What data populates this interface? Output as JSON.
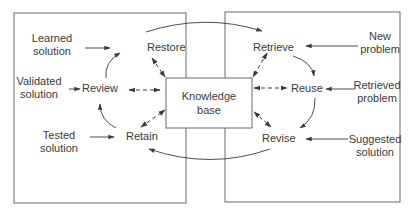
{
  "diagram": {
    "type": "CBR cycle with knowledge base",
    "center": {
      "label_line1": "Knowledge",
      "label_line2": "base"
    },
    "left_cycle": {
      "nodes": [
        "Restore",
        "Review",
        "Retain"
      ],
      "inputs": [
        {
          "line1": "Learned",
          "line2": "solution",
          "target": "Restore"
        },
        {
          "line1": "Validated",
          "line2": "solution",
          "target": "Review"
        },
        {
          "line1": "Tested",
          "line2": "solution",
          "target": "Retain"
        }
      ]
    },
    "right_cycle": {
      "nodes": [
        "Retrieve",
        "Reuse",
        "Revise"
      ],
      "inputs": [
        {
          "line1": "New",
          "line2": "problem",
          "target": "Retrieve"
        },
        {
          "line1": "Retrieved",
          "line2": "problem",
          "target": "Reuse"
        },
        {
          "line1": "Suggested",
          "line2": "solution",
          "target": "Revise"
        }
      ]
    },
    "edges": [
      {
        "from": "Retain",
        "to": "Review",
        "style": "solid"
      },
      {
        "from": "Review",
        "to": "Restore",
        "style": "solid"
      },
      {
        "from": "Restore",
        "to": "Retrieve",
        "style": "solid"
      },
      {
        "from": "Retrieve",
        "to": "Reuse",
        "style": "solid"
      },
      {
        "from": "Reuse",
        "to": "Revise",
        "style": "solid"
      },
      {
        "from": "Revise",
        "to": "Retain",
        "style": "solid"
      },
      {
        "from": "Knowledge base",
        "to": "Restore",
        "style": "dashed-bidirectional"
      },
      {
        "from": "Knowledge base",
        "to": "Review",
        "style": "dashed-bidirectional"
      },
      {
        "from": "Knowledge base",
        "to": "Retain",
        "style": "dashed-bidirectional"
      },
      {
        "from": "Knowledge base",
        "to": "Retrieve",
        "style": "dashed-bidirectional"
      },
      {
        "from": "Knowledge base",
        "to": "Reuse",
        "style": "dashed-bidirectional"
      },
      {
        "from": "Knowledge base",
        "to": "Revise",
        "style": "dashed-bidirectional"
      }
    ]
  }
}
